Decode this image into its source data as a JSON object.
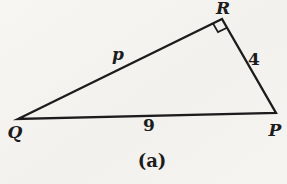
{
  "diagram": {
    "caption": "(a)",
    "vertices": {
      "top_right": "R",
      "bottom_left": "Q",
      "bottom_right": "P"
    },
    "sides": {
      "qr_hypotenuse": "p",
      "rp_right": "4",
      "qp_bottom": "9"
    },
    "right_angle_at_vertex": "R",
    "colors": {
      "ink": "#1c1c1c",
      "paper": "#f4f3ef"
    }
  }
}
